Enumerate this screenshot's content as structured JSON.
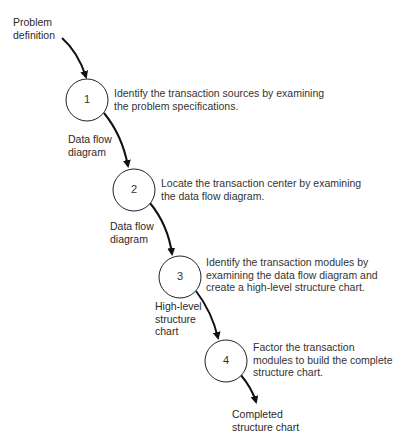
{
  "diagram": {
    "input_label": "Problem\ndefinition",
    "output_label": "Completed\nstructure chart",
    "steps": [
      {
        "number": "1",
        "description": "Identify the transaction sources by examining\nthe problem specifications.",
        "output_label": "Data flow\ndiagram"
      },
      {
        "number": "2",
        "description": "Locate the transaction center by examining\nthe data flow diagram.",
        "output_label": "Data flow\ndiagram"
      },
      {
        "number": "3",
        "description": "Identify the transaction modules by\nexamining the data flow diagram and\ncreate a high-level structure chart.",
        "output_label": "High-level\nstructure\nchart"
      },
      {
        "number": "4",
        "description": "Factor the transaction\nmodules to build the complete\nstructure chart."
      }
    ]
  }
}
